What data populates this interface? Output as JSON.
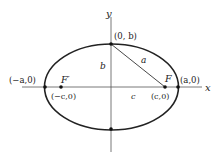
{
  "diagram": {
    "axes": {
      "x_label": "x",
      "y_label": "y"
    },
    "points": {
      "top_vertex": "(0, b)",
      "left_vertex": "(−a,0)",
      "right_vertex": "(a,0)",
      "left_focus_coord": "(−c,0)",
      "right_focus_coord": "(c,0)"
    },
    "focus_labels": {
      "left": "F′",
      "right": "F"
    },
    "segment_labels": {
      "a": "a",
      "b": "b",
      "c": "c"
    },
    "colors": {
      "stroke": "#222222",
      "background": "#ffffff"
    }
  }
}
